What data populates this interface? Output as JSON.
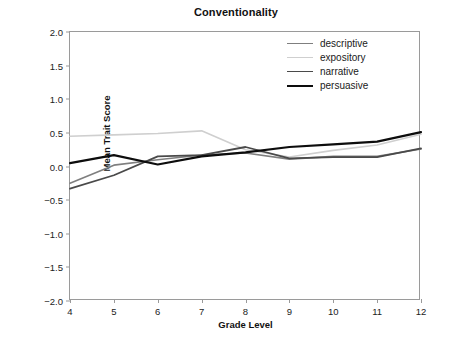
{
  "chart_data": {
    "type": "line",
    "title": "Conventionality",
    "xlabel": "Grade Level",
    "ylabel": "Mean Trait Score",
    "x": [
      4,
      5,
      6,
      7,
      8,
      9,
      10,
      11,
      12
    ],
    "xtick_labels": [
      "4",
      "5",
      "6",
      "7",
      "8",
      "9",
      "10",
      "11",
      "12"
    ],
    "xlim": [
      4,
      12
    ],
    "ylim": [
      -2.0,
      2.0
    ],
    "ytick_labels": [
      "2.0",
      "1.5",
      "1.0",
      "0.5",
      "0.0",
      "-0.5",
      "-1.0",
      "-1.5",
      "-2.0"
    ],
    "ytick_values": [
      2.0,
      1.5,
      1.0,
      0.5,
      0.0,
      -0.5,
      -1.0,
      -1.5,
      -2.0
    ],
    "grid": false,
    "legend_position": "top-right",
    "series": [
      {
        "name": "descriptive",
        "color": "#7f7f7f",
        "width": 1.6,
        "values": [
          -0.25,
          0.02,
          0.1,
          0.17,
          0.2,
          0.11,
          0.15,
          0.15,
          0.26
        ]
      },
      {
        "name": "expository",
        "color": "#cfcfcf",
        "width": 1.6,
        "values": [
          0.45,
          0.47,
          0.49,
          0.53,
          0.25,
          0.14,
          0.24,
          0.32,
          0.48
        ]
      },
      {
        "name": "narrative",
        "color": "#4a4a4a",
        "width": 1.8,
        "values": [
          -0.33,
          -0.13,
          0.15,
          0.17,
          0.29,
          0.12,
          0.14,
          0.14,
          0.27
        ]
      },
      {
        "name": "persuasive",
        "color": "#0d0d0d",
        "width": 2.2,
        "values": [
          0.05,
          0.17,
          0.03,
          0.15,
          0.21,
          0.29,
          0.33,
          0.37,
          0.51
        ]
      }
    ]
  },
  "legend": {
    "items": [
      {
        "label": "descriptive"
      },
      {
        "label": "expository"
      },
      {
        "label": "narrative"
      },
      {
        "label": "persuasive"
      }
    ]
  }
}
